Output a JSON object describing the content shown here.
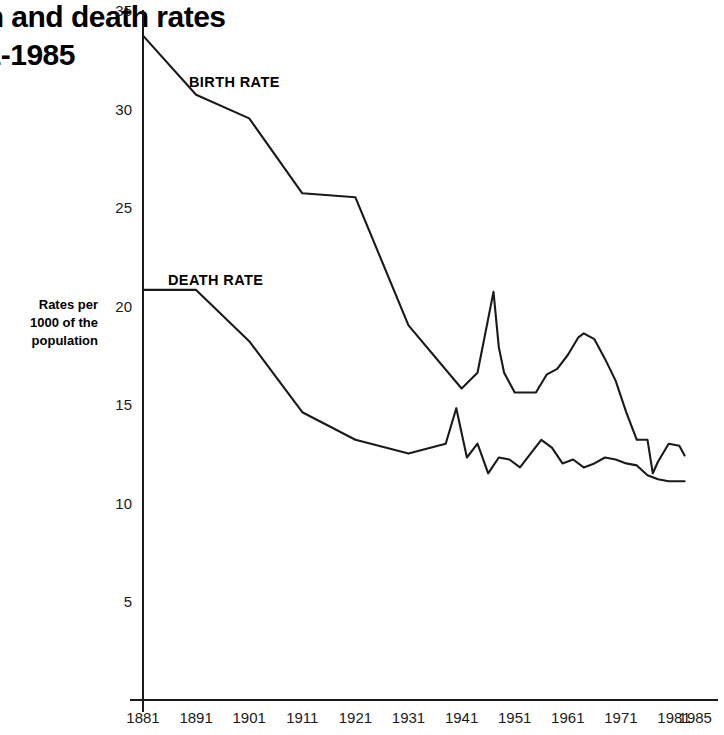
{
  "title": {
    "lines": [
      "Birth and death rates",
      "1881-1985"
    ],
    "note_cropped": "ates",
    "note_cropped2": "985"
  },
  "axis_caption": {
    "lines": [
      "Rates per",
      "1000 of the",
      "population"
    ]
  },
  "series_labels": {
    "birth": "BIRTH RATE",
    "death": "DEATH RATE"
  },
  "colors": {
    "line": "#1a1a1a",
    "axis": "#1a1a1a",
    "text": "#111111",
    "background": "#ffffff"
  },
  "chart_data": {
    "type": "line",
    "title": "Birth and death rates 1881-1985",
    "xlabel": "",
    "ylabel": "Rates per 1000 of the population",
    "xlim": [
      1881,
      1985
    ],
    "ylim": [
      0,
      35
    ],
    "yticks": [
      5,
      10,
      15,
      20,
      25,
      30,
      35
    ],
    "xticks": [
      1881,
      1891,
      1901,
      1911,
      1921,
      1931,
      1941,
      1951,
      1961,
      1971,
      1981,
      1985
    ],
    "grid": false,
    "legend": "inline-labels",
    "series": [
      {
        "name": "BIRTH RATE",
        "x": [
          1881,
          1891,
          1901,
          1911,
          1921,
          1931,
          1941,
          1944,
          1947,
          1948,
          1949,
          1951,
          1953,
          1955,
          1957,
          1959,
          1961,
          1963,
          1964,
          1966,
          1968,
          1970,
          1972,
          1974,
          1976,
          1977,
          1978,
          1980,
          1982,
          1983
        ],
        "values": [
          33.7,
          30.7,
          29.5,
          25.7,
          25.5,
          19.0,
          15.8,
          16.6,
          20.7,
          17.9,
          16.6,
          15.6,
          15.6,
          15.6,
          16.5,
          16.8,
          17.5,
          18.4,
          18.6,
          18.3,
          17.3,
          16.2,
          14.6,
          13.2,
          13.2,
          11.5,
          12.1,
          13.0,
          12.9,
          12.4
        ]
      },
      {
        "name": "DEATH RATE",
        "x": [
          1881,
          1891,
          1901,
          1911,
          1921,
          1931,
          1938,
          1940,
          1942,
          1944,
          1946,
          1948,
          1950,
          1952,
          1954,
          1956,
          1958,
          1960,
          1962,
          1964,
          1966,
          1968,
          1970,
          1972,
          1974,
          1976,
          1978,
          1980,
          1983
        ],
        "values": [
          20.8,
          20.8,
          18.2,
          14.6,
          13.2,
          12.5,
          13.0,
          14.8,
          12.3,
          13.0,
          11.5,
          12.3,
          12.2,
          11.8,
          12.5,
          13.2,
          12.8,
          12.0,
          12.2,
          11.8,
          12.0,
          12.3,
          12.2,
          12.0,
          11.9,
          11.4,
          11.2,
          11.1,
          11.1
        ]
      }
    ]
  }
}
